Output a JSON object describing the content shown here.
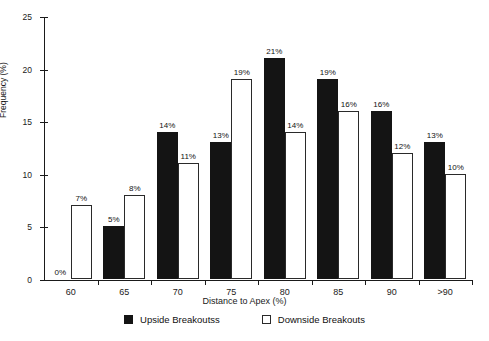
{
  "chart_data": {
    "type": "bar",
    "title": "",
    "categories": [
      "60",
      "65",
      "70",
      "75",
      "80",
      "85",
      "90",
      ">90"
    ],
    "series": [
      {
        "name": "Upside Breakoutss",
        "color": "#141414",
        "style": "filled",
        "values": [
          0,
          5,
          14,
          13,
          21,
          19,
          16,
          13
        ],
        "labels": [
          "0%",
          "5%",
          "14%",
          "13%",
          "21%",
          "19%",
          "16%",
          "13%"
        ]
      },
      {
        "name": "Downside Breakouts",
        "color": "#ffffff",
        "style": "outlined",
        "values": [
          7,
          8,
          11,
          19,
          14,
          16,
          12,
          10
        ],
        "labels": [
          "7%",
          "8%",
          "11%",
          "19%",
          "14%",
          "16%",
          "12%",
          "10%"
        ]
      }
    ],
    "xlabel": "Distance to Apex (%)",
    "ylabel": "Frequency (%)",
    "ylim": [
      0,
      25
    ],
    "yticks": [
      0,
      5,
      10,
      15,
      20,
      25
    ],
    "ytick_labels": [
      "0",
      "5",
      "10",
      "15",
      "20",
      "25"
    ],
    "grid": false,
    "legend_position": "bottom"
  },
  "legend": {
    "items": [
      {
        "label": "Upside Breakoutss",
        "swatch": "filled-black-square"
      },
      {
        "label": "Downside Breakouts",
        "swatch": "outlined-white-square"
      }
    ]
  }
}
